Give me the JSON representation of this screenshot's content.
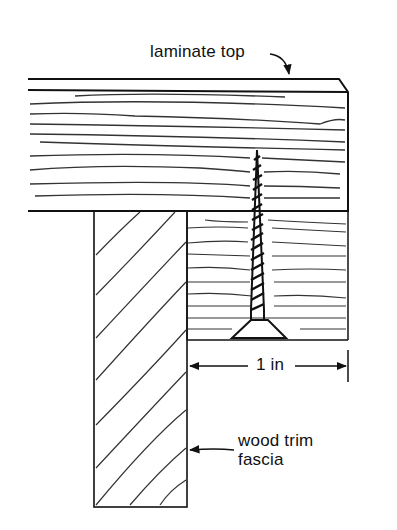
{
  "diagram": {
    "type": "cross-section technical illustration",
    "labels": {
      "laminate_top": "laminate top",
      "dimension": "1 in",
      "wood_trim_line1": "wood trim",
      "wood_trim_line2": "fascia"
    },
    "components": [
      "laminate top",
      "substrate",
      "wood screw",
      "wood trim fascia"
    ],
    "colors": {
      "ink": "#111111",
      "paper": "#ffffff"
    }
  }
}
